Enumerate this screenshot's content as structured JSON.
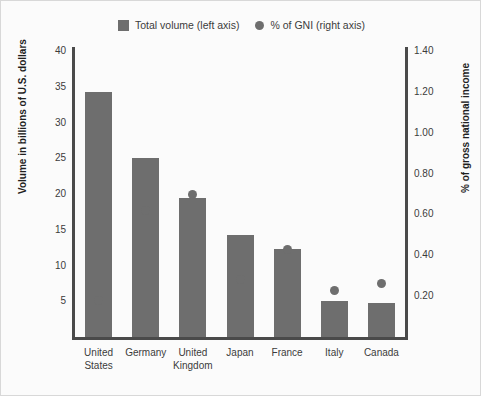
{
  "chart_data": {
    "type": "bar",
    "title": "",
    "subtitle": "",
    "categories": [
      "United States",
      "Germany",
      "United Kingdom",
      "Japan",
      "France",
      "Italy",
      "Canada"
    ],
    "category_lines": [
      [
        "United",
        "States"
      ],
      [
        "Germany"
      ],
      [
        "United",
        "Kingdom"
      ],
      [
        "Japan"
      ],
      [
        "France"
      ],
      [
        "Italy"
      ],
      [
        "Canada"
      ]
    ],
    "series": [
      {
        "name": "Total volume (left axis)",
        "type": "bar",
        "axis": "left",
        "color": "#6e6e6e",
        "values": [
          34.2,
          25.0,
          19.5,
          14.3,
          12.3,
          5.0,
          4.8
        ]
      },
      {
        "name": "% of GNI (right axis)",
        "type": "scatter",
        "axis": "right",
        "color": "#6e6e6e",
        "values": [
          0.18,
          0.62,
          0.7,
          0.28,
          0.43,
          0.23,
          0.26
        ]
      }
    ],
    "xlabel": "",
    "ylabel": "Volume in billions of U.S. dollars",
    "y2label": "% of gross national income",
    "ylim": [
      0,
      40
    ],
    "y2lim": [
      0,
      1.4
    ],
    "yticks": [
      "5",
      "10",
      "15",
      "20",
      "25",
      "30",
      "35",
      "40"
    ],
    "ytick_values": [
      5,
      10,
      15,
      20,
      25,
      30,
      35,
      40
    ],
    "y2ticks": [
      "0.20",
      "0.40",
      "0.60",
      "0.80",
      "1.00",
      "1.20",
      "1.40"
    ],
    "y2tick_values": [
      0.2,
      0.4,
      0.6,
      0.8,
      1.0,
      1.2,
      1.4
    ],
    "grid": false,
    "legend_position": "top-center"
  },
  "legend": {
    "entries": [
      {
        "label": "Total volume (left axis)",
        "marker": "square-swatch-icon"
      },
      {
        "label": "% of GNI (right axis)",
        "marker": "circle-swatch-icon"
      }
    ]
  },
  "axes": {
    "left_title": "Volume in billions of U.S. dollars",
    "right_title": "% of gross national income"
  },
  "colors": {
    "bar": "#6e6e6e",
    "dot": "#6e6e6e",
    "axis_line": "#4a4a4a",
    "background": "#fbfbfb",
    "text": "#3b3b3b"
  }
}
